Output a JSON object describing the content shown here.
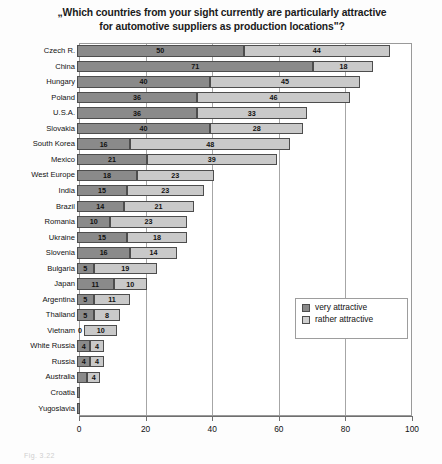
{
  "chart_data": {
    "type": "bar",
    "orientation": "horizontal",
    "stacked": true,
    "title": "„Which countries from your sight currently are particularly attractive for automotive suppliers as production locations\"?",
    "title_line_1": "„Which countries from your sight currently are particularly attractive",
    "title_line_2": "for automotive suppliers as production locations\"?",
    "xlabel": "",
    "ylabel": "",
    "xlim": [
      0,
      100
    ],
    "xticks": [
      0,
      20,
      40,
      60,
      80,
      100
    ],
    "xtick_labels": [
      "0",
      "20",
      "40",
      "60",
      "80",
      "100"
    ],
    "grid": true,
    "legend_position": "center-right-inside",
    "categories": [
      "Czech R.",
      "China",
      "Hungary",
      "Poland",
      "U.S.A.",
      "Slovakia",
      "South Korea",
      "Mexico",
      "West Europe",
      "India",
      "Brazil",
      "Romania",
      "Ukraine",
      "Slovenia",
      "Bulgaria",
      "Japan",
      "Argentina",
      "Thailand",
      "Vietnam",
      "White Russia",
      "Russia",
      "Australia",
      "Croatia",
      "Yugoslavia"
    ],
    "series": [
      {
        "name": "very attractive",
        "color": "#8a8a8a",
        "values": [
          50,
          71,
          40,
          36,
          36,
          40,
          16,
          21,
          18,
          15,
          14,
          10,
          15,
          16,
          5,
          11,
          5,
          5,
          0,
          4,
          4,
          3,
          1,
          1
        ]
      },
      {
        "name": "rather attractive",
        "color": "#c9c9c9",
        "values": [
          44,
          18,
          45,
          46,
          33,
          28,
          48,
          39,
          23,
          23,
          21,
          23,
          18,
          14,
          19,
          10,
          11,
          8,
          10,
          4,
          4,
          4,
          0,
          0
        ]
      }
    ],
    "bar_labels": [
      {
        "category": "Czech R.",
        "very": "50",
        "rather": "44"
      },
      {
        "category": "China",
        "very": "71",
        "rather": "18"
      },
      {
        "category": "Hungary",
        "very": "40",
        "rather": "45"
      },
      {
        "category": "Poland",
        "very": "36",
        "rather": "46"
      },
      {
        "category": "U.S.A.",
        "very": "36",
        "rather": "33"
      },
      {
        "category": "Slovakia",
        "very": "40",
        "rather": "28"
      },
      {
        "category": "South Korea",
        "very": "16",
        "rather": "48"
      },
      {
        "category": "Mexico",
        "very": "21",
        "rather": "39"
      },
      {
        "category": "West Europe",
        "very": "18",
        "rather": "23"
      },
      {
        "category": "India",
        "very": "15",
        "rather": "23"
      },
      {
        "category": "Brazil",
        "very": "14",
        "rather": "21"
      },
      {
        "category": "Romania",
        "very": "10",
        "rather": "23"
      },
      {
        "category": "Ukraine",
        "very": "15",
        "rather": "18"
      },
      {
        "category": "Slovenia",
        "very": "16",
        "rather": "14"
      },
      {
        "category": "Bulgaria",
        "very": "5",
        "rather": "19"
      },
      {
        "category": "Japan",
        "very": "11",
        "rather": "10"
      },
      {
        "category": "Argentina",
        "very": "5",
        "rather": "11"
      },
      {
        "category": "Thailand",
        "very": "5",
        "rather": "8"
      },
      {
        "category": "Vietnam",
        "very": "0",
        "rather": "10"
      },
      {
        "category": "White Russia",
        "very": "4",
        "rather": "4"
      },
      {
        "category": "Russia",
        "very": "4",
        "rather": "4"
      },
      {
        "category": "Australia",
        "very": "3",
        "rather": "4"
      },
      {
        "category": "Croatia",
        "very": "",
        "rather": ""
      },
      {
        "category": "Yugoslavia",
        "very": "",
        "rather": ""
      }
    ],
    "legend": [
      {
        "label": "very attractive",
        "color": "#8a8a8a"
      },
      {
        "label": "rather attractive",
        "color": "#cfcfcf"
      }
    ]
  },
  "caption": "Fig. 3.22"
}
